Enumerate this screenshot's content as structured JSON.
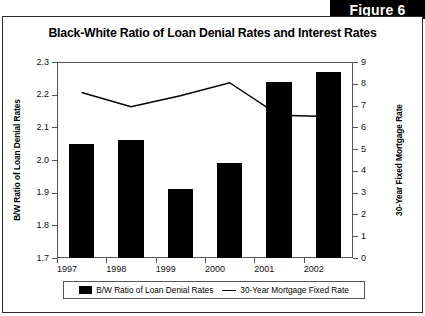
{
  "figure": {
    "badge": "Figure 6"
  },
  "chart_data": {
    "type": "bar",
    "title": "Black-White Ratio of Loan Denial Rates and Interest Rates",
    "xlabel": "",
    "ylabel": "B/W Ratio of Loan Denial Rates",
    "y2label": "30-Year Fixed Mortgage Rate",
    "categories": [
      "1997",
      "1998",
      "1999",
      "2000",
      "2001",
      "2002"
    ],
    "xtick_labels": [
      "1997",
      "1998",
      "1999",
      "2000",
      "2001",
      "2002"
    ],
    "ylim": [
      1.7,
      2.3
    ],
    "yticks": [
      1.7,
      1.8,
      1.9,
      2.0,
      2.1,
      2.2,
      2.3
    ],
    "ytick_labels": [
      "1.7",
      "1.8",
      "1.9",
      "2.0",
      "2.1",
      "2.2",
      "2.3"
    ],
    "y2lim": [
      0,
      9
    ],
    "y2ticks": [
      0,
      1,
      2,
      3,
      4,
      5,
      6,
      7,
      8,
      9
    ],
    "y2tick_labels": [
      "0",
      "1",
      "2",
      "3",
      "4",
      "5",
      "6",
      "7",
      "8",
      "9"
    ],
    "grid": false,
    "legend_position": "bottom",
    "series": [
      {
        "name": "B/W Ratio of Loan Denial Rates",
        "type": "bar",
        "axis": "left",
        "color": "#000000",
        "values": [
          2.05,
          2.06,
          1.91,
          1.99,
          2.24,
          2.27
        ]
      },
      {
        "name": "30-Year Mortgage Fixed Rate",
        "type": "line",
        "axis": "right",
        "color": "#000000",
        "values": [
          7.6,
          6.95,
          7.45,
          8.05,
          6.55,
          6.5
        ]
      }
    ]
  }
}
